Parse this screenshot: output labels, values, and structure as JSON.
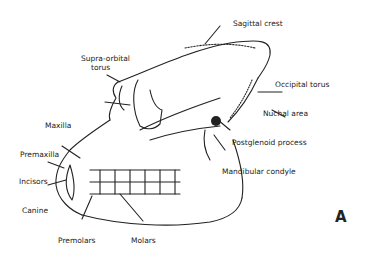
{
  "figure": {
    "panel_letter": "A",
    "labels": {
      "sagittal_crest": "Sagittal crest",
      "supra_orbital_torus_1": "Supra-orbital",
      "supra_orbital_torus_2": "torus",
      "occipital_torus": "Occipital torus",
      "nuchal_area": "Nuchal area",
      "maxilla": "Maxilla",
      "postglenoid_process": "Postglenoid process",
      "premaxilla": "Premaxilla",
      "mandibular_condyle": "Mandibular condyle",
      "incisors": "Incisors",
      "canine": "Canine",
      "premolars": "Premolars",
      "molars": "Molars"
    }
  }
}
